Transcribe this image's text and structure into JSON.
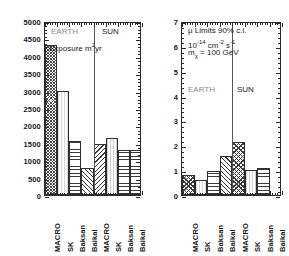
{
  "figure": {
    "panels": [
      {
        "id": "exposure",
        "annotations": {
          "earth": "EARTH",
          "sun": "SUN",
          "quantity": "Exposure m",
          "quantity_sup": "2",
          "quantity_tail": "yr"
        }
      },
      {
        "id": "mu-limits",
        "annotations": {
          "line1_a": "μ Limits 90% c.l.",
          "line2_base": "10",
          "line2_exp": "-14",
          "line2_mid": " cm",
          "line2_exp2": "-2",
          "line2_mid2": " s",
          "line2_exp3": "-1",
          "line3_m": "m",
          "line3_sub": "χ",
          "line3_rest": " = 100 GeV",
          "earth": "EARTH",
          "sun": "SUN"
        }
      }
    ]
  },
  "chart_data": [
    {
      "type": "bar",
      "id": "exposure",
      "title": "Exposure m²yr",
      "xlabel": "",
      "ylabel": "Exposure m²yr",
      "ylim": [
        0,
        5000
      ],
      "ytick_labels": [
        "5000",
        "4500",
        "4000",
        "3500",
        "3000",
        "2500",
        "2000",
        "1500",
        "1000",
        "500",
        "0"
      ],
      "ytick_values": [
        5000,
        4500,
        4000,
        3500,
        3000,
        2500,
        2000,
        1500,
        1000,
        500,
        0
      ],
      "grid": false,
      "legend": "none",
      "groups": [
        "EARTH",
        "SUN"
      ],
      "categories": [
        "MACRO",
        "SK",
        "Baksan",
        "Baikal",
        "MACRO",
        "SK",
        "Baksan",
        "Baikal"
      ],
      "values": [
        4300,
        3000,
        1550,
        780,
        1480,
        1650,
        1300,
        1300
      ],
      "fills": [
        "dots",
        "light",
        "hlines",
        "diag",
        "diag2",
        "vlines",
        "hlines",
        "hlines"
      ]
    },
    {
      "type": "bar",
      "id": "mu-limits",
      "title": "μ Limits 90% c.l.",
      "xlabel": "",
      "ylabel": "10^-14 cm^-2 s^-1",
      "ylim": [
        0,
        7
      ],
      "ytick_labels": [
        "7",
        "6",
        "5",
        "4",
        "3",
        "2",
        "1",
        "0"
      ],
      "ytick_values": [
        7,
        6,
        5,
        4,
        3,
        2,
        1,
        0
      ],
      "grid": false,
      "legend": "none",
      "groups": [
        "EARTH",
        "SUN"
      ],
      "categories": [
        "MACRO",
        "SK",
        "Baksan",
        "Baikal",
        "MACRO",
        "SK",
        "Baksan",
        "Baikal"
      ],
      "values": [
        0.8,
        0.6,
        0.95,
        1.55,
        2.15,
        1.0,
        1.1,
        0.0
      ],
      "fills": [
        "cross",
        "light",
        "hlines",
        "diag",
        "cross",
        "vlines",
        "hlines",
        "none"
      ]
    }
  ],
  "xtick_labels": [
    "MACRO",
    "SK",
    "Baksan",
    "Baikal",
    "MACRO",
    "SK",
    "Baksan",
    "Baikal"
  ],
  "colors": {
    "axis": "#2a2a2a",
    "text": "#161616",
    "divider": "#555555",
    "grey_text": "#8a8a8a",
    "background": "#ffffff"
  }
}
